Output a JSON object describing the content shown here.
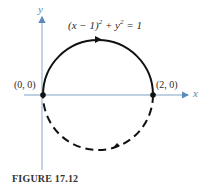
{
  "figure": {
    "caption": "FIGURE 17.12",
    "equation": "(x − 1)² + y² = 1",
    "equation_parts": {
      "a": "(x − 1)",
      "exp1": "2",
      "b": " + y",
      "exp2": "2",
      "c": " = 1"
    },
    "axes": {
      "x_label": "x",
      "y_label": "y"
    },
    "points": [
      {
        "label": "(0, 0)"
      },
      {
        "label": "(2, 0)"
      }
    ],
    "curve": {
      "upper_half": "solid",
      "lower_half": "dashed",
      "orientation": "clockwise"
    },
    "colors": {
      "axis": "#5a8ab8",
      "curve": "#111111"
    }
  }
}
